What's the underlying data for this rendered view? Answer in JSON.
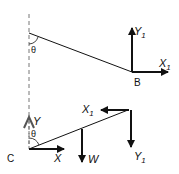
{
  "diagram": {
    "type": "free-body diagram",
    "top": {
      "angle_label": "θ",
      "point_label": "B",
      "forces": [
        {
          "name": "Y",
          "sub": "1",
          "direction": "up"
        },
        {
          "name": "X",
          "sub": "1",
          "direction": "right"
        }
      ]
    },
    "bottom": {
      "angle_label": "θ",
      "point_label": "C",
      "forces": [
        {
          "name": "Y",
          "sub": "",
          "direction": "up"
        },
        {
          "name": "X",
          "sub": "",
          "direction": "right"
        },
        {
          "name": "W",
          "sub": "",
          "direction": "down"
        },
        {
          "name": "X",
          "sub": "1",
          "direction": "left"
        },
        {
          "name": "Y",
          "sub": "1",
          "direction": "down"
        }
      ]
    },
    "colors": {
      "line": "#111111",
      "dashed": "#777777"
    }
  }
}
